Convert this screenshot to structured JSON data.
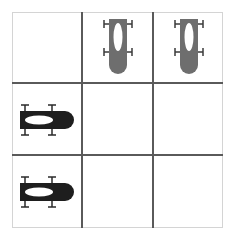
{
  "board": {
    "rows": 3,
    "cols": 3,
    "line_color": "#5a5a5a",
    "border_color": "#d4d4d4"
  },
  "pieces": [
    {
      "row": 0,
      "col": 1,
      "type": "car",
      "orientation": "vertical",
      "facing": "down",
      "color": "#6e6e6e"
    },
    {
      "row": 0,
      "col": 2,
      "type": "car",
      "orientation": "vertical",
      "facing": "down",
      "color": "#6e6e6e"
    },
    {
      "row": 1,
      "col": 0,
      "type": "car",
      "orientation": "horizontal",
      "facing": "right",
      "color": "#1e1e1e"
    },
    {
      "row": 2,
      "col": 0,
      "type": "car",
      "orientation": "horizontal",
      "facing": "right",
      "color": "#1e1e1e"
    }
  ],
  "icons": {
    "car": "race-car-icon"
  }
}
